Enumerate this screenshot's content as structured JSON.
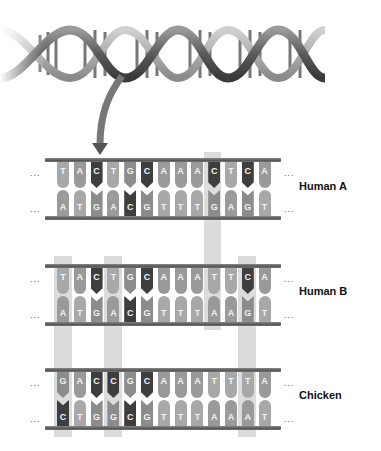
{
  "figure": {
    "colors": {
      "A": "#9a9a9a",
      "T": "#a8a8a8",
      "G": "#8c8c8c",
      "C": "#3e3e3e",
      "rail": "#666666",
      "highlight": "#d6d6d6"
    },
    "ellipsis": "...",
    "strands": [
      {
        "label": "Human A",
        "top": [
          "T",
          "A",
          "C",
          "T",
          "G",
          "C",
          "A",
          "A",
          "A",
          "C",
          "T",
          "C",
          "A"
        ],
        "bottom": [
          "A",
          "T",
          "G",
          "A",
          "C",
          "G",
          "T",
          "T",
          "T",
          "G",
          "A",
          "G",
          "T"
        ]
      },
      {
        "label": "Human B",
        "top": [
          "T",
          "A",
          "C",
          "T",
          "G",
          "C",
          "A",
          "A",
          "A",
          "T",
          "T",
          "C",
          "A"
        ],
        "bottom": [
          "A",
          "T",
          "G",
          "A",
          "C",
          "G",
          "T",
          "T",
          "T",
          "A",
          "A",
          "G",
          "T"
        ]
      },
      {
        "label": "Chicken",
        "top": [
          "G",
          "A",
          "C",
          "C",
          "G",
          "C",
          "A",
          "A",
          "A",
          "T",
          "T",
          "T",
          "A"
        ],
        "bottom": [
          "C",
          "T",
          "G",
          "G",
          "C",
          "G",
          "T",
          "T",
          "T",
          "A",
          "A",
          "A",
          "T"
        ]
      }
    ],
    "highlights": [
      {
        "position": 10,
        "from_strand": "Human A",
        "to_strand": "Human B"
      },
      {
        "position": 1,
        "from_strand": "Human B",
        "to_strand": "Chicken"
      },
      {
        "position": 4,
        "from_strand": "Human B",
        "to_strand": "Chicken"
      },
      {
        "position": 12,
        "from_strand": "Human B",
        "to_strand": "Chicken"
      }
    ]
  }
}
